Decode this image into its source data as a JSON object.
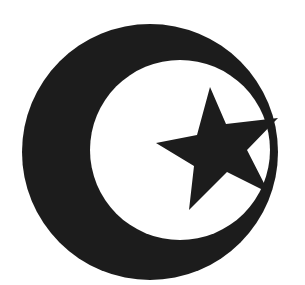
{
  "symbol": {
    "description": "Crescent and star",
    "colors": {
      "background": "#ffffff",
      "fill": "#1c1c1c"
    }
  }
}
